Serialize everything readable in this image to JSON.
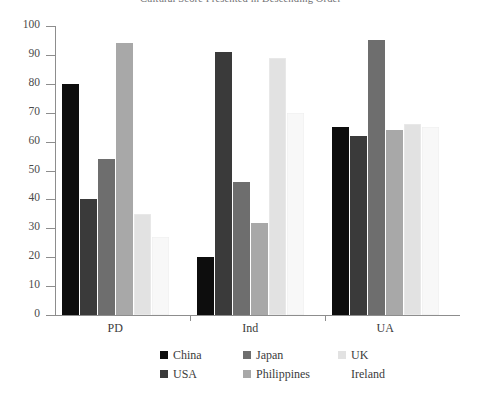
{
  "chart_data": {
    "type": "bar",
    "title": "Cultural Score Presented in Descending Order",
    "xlabel": "",
    "ylabel": "",
    "ylim": [
      0,
      100
    ],
    "ytick_step": 10,
    "yticks": [
      0,
      10,
      20,
      30,
      40,
      50,
      60,
      70,
      80,
      90,
      100
    ],
    "grid": false,
    "legend_position": "bottom",
    "categories": [
      "PD",
      "Ind",
      "UA"
    ],
    "series": [
      {
        "name": "China",
        "color": "#0d0d0d",
        "values": [
          80,
          20,
          65
        ]
      },
      {
        "name": "USA",
        "color": "#3a3a3a",
        "values": [
          40,
          91,
          62
        ]
      },
      {
        "name": "Japan",
        "color": "#6e6e6e",
        "values": [
          54,
          46,
          95
        ]
      },
      {
        "name": "Philippines",
        "color": "#a8a8a8",
        "values": [
          94,
          32,
          64
        ]
      },
      {
        "name": "UK",
        "color": "#e2e2e2",
        "values": [
          35,
          89,
          66
        ]
      },
      {
        "name": "Ireland",
        "color": "#f8f8f8",
        "values": [
          27,
          70,
          65
        ]
      }
    ]
  },
  "legend": {
    "rows": [
      [
        "China",
        "Japan",
        "UK"
      ],
      [
        "USA",
        "Philippines",
        "Ireland"
      ]
    ]
  }
}
